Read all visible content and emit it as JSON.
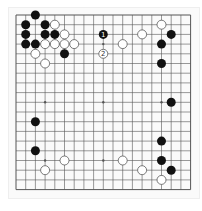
{
  "board": {
    "size": 19,
    "origin": [
      16,
      15
    ],
    "spacing": 9.7,
    "line_color": "#555555",
    "black_color": "#111111",
    "white_color": "#ffffff",
    "star_points": [
      [
        3,
        3
      ],
      [
        9,
        3
      ],
      [
        15,
        3
      ],
      [
        3,
        9
      ],
      [
        9,
        9
      ],
      [
        15,
        9
      ],
      [
        3,
        15
      ],
      [
        9,
        15
      ],
      [
        15,
        15
      ]
    ],
    "stones": [
      {
        "c": 2,
        "r": 0,
        "color": "black"
      },
      {
        "c": 1,
        "r": 1,
        "color": "black"
      },
      {
        "c": 3,
        "r": 1,
        "color": "black"
      },
      {
        "c": 4,
        "r": 1,
        "color": "white"
      },
      {
        "c": 1,
        "r": 2,
        "color": "black"
      },
      {
        "c": 3,
        "r": 2,
        "color": "black"
      },
      {
        "c": 4,
        "r": 2,
        "color": "black"
      },
      {
        "c": 5,
        "r": 2,
        "color": "white"
      },
      {
        "c": 1,
        "r": 3,
        "color": "black"
      },
      {
        "c": 2,
        "r": 3,
        "color": "black"
      },
      {
        "c": 3,
        "r": 3,
        "color": "white"
      },
      {
        "c": 4,
        "r": 3,
        "color": "white"
      },
      {
        "c": 5,
        "r": 3,
        "color": "white"
      },
      {
        "c": 6,
        "r": 3,
        "color": "white"
      },
      {
        "c": 2,
        "r": 4,
        "color": "white"
      },
      {
        "c": 5,
        "r": 4,
        "color": "black"
      },
      {
        "c": 3,
        "r": 5,
        "color": "white"
      },
      {
        "c": 9,
        "r": 2,
        "color": "black",
        "label": "1"
      },
      {
        "c": 9,
        "r": 4,
        "color": "white",
        "label": "2"
      },
      {
        "c": 11,
        "r": 3,
        "color": "white"
      },
      {
        "c": 13,
        "r": 2,
        "color": "white"
      },
      {
        "c": 15,
        "r": 1,
        "color": "white"
      },
      {
        "c": 16,
        "r": 2,
        "color": "black"
      },
      {
        "c": 15,
        "r": 3,
        "color": "black"
      },
      {
        "c": 15,
        "r": 5,
        "color": "black"
      },
      {
        "c": 16,
        "r": 9,
        "color": "black"
      },
      {
        "c": 2,
        "r": 11,
        "color": "black"
      },
      {
        "c": 2,
        "r": 14,
        "color": "black"
      },
      {
        "c": 5,
        "r": 15,
        "color": "white"
      },
      {
        "c": 3,
        "r": 16,
        "color": "white"
      },
      {
        "c": 15,
        "r": 13,
        "color": "black"
      },
      {
        "c": 11,
        "r": 15,
        "color": "white"
      },
      {
        "c": 15,
        "r": 15,
        "color": "black"
      },
      {
        "c": 13,
        "r": 16,
        "color": "white"
      },
      {
        "c": 16,
        "r": 16,
        "color": "black"
      },
      {
        "c": 15,
        "r": 17,
        "color": "white"
      }
    ]
  }
}
